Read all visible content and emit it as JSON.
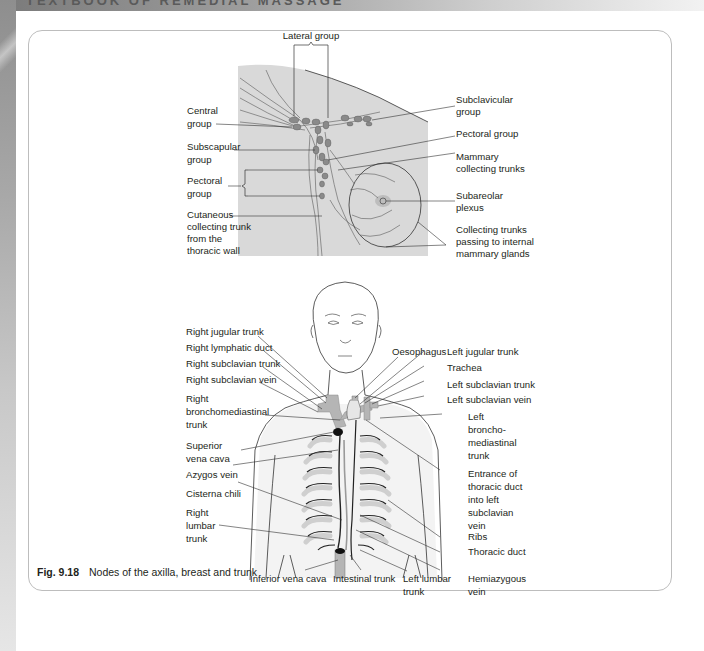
{
  "header": {
    "running_title": "TEXTBOOK OF REMEDIAL MASSAGE"
  },
  "colors": {
    "label_text": "#231f20",
    "diagram_fill": "#d9d9d9",
    "node_fill": "#8a8a8a",
    "vessel_fill": "#b5b5b5",
    "card_border": "#bdbdbd"
  },
  "figure": {
    "number": "Fig. 9.18",
    "caption": "Nodes of the axilla, breast and trunk",
    "axilla_diagram": {
      "labels": {
        "lateral_group": "Lateral group",
        "central_group": [
          "Central",
          "group"
        ],
        "subscapular_group": [
          "Subscapular",
          "group"
        ],
        "pectoral_group_left": [
          "Pectoral",
          "group"
        ],
        "cutaneous_trunk": [
          "Cutaneous",
          "collecting trunk",
          "from the",
          "thoracic wall"
        ],
        "subclavicular_group": [
          "Subclavicular",
          "group"
        ],
        "pectoral_group_right": "Pectoral group",
        "mammary_collecting_trunks": [
          "Mammary",
          "collecting trunks"
        ],
        "subareolar_plexus": [
          "Subareolar",
          "plexus"
        ],
        "collecting_trunks_internal": [
          "Collecting trunks",
          "passing to internal",
          "mammary glands"
        ]
      }
    },
    "trunk_diagram": {
      "labels": {
        "right_jugular_trunk": "Right jugular trunk",
        "right_lymphatic_duct": "Right lymphatic duct",
        "right_subclavian_trunk": "Right subclavian trunk",
        "right_subclavian_vein": "Right subclavian vein",
        "right_bronchomediastinal_trunk": [
          "Right",
          "bronchomediastinal",
          "trunk"
        ],
        "superior_vena_cava": [
          "Superior",
          "vena cava"
        ],
        "azygos_vein": "Azygos vein",
        "cisterna_chili": "Cisterna chili",
        "right_lumbar_trunk": [
          "Right",
          "lumbar",
          "trunk"
        ],
        "oesophagus": "Oesophagus",
        "left_jugular_trunk": "Left jugular trunk",
        "trachea": "Trachea",
        "left_subclavian_trunk": "Left subclavian trunk",
        "left_subclavian_vein": "Left subclavian vein",
        "left_bronchomediastinal_trunk": [
          "Left",
          "broncho-",
          "mediastinal",
          "trunk"
        ],
        "entrance_thoracic_duct": [
          "Entrance of",
          "thoracic duct",
          "into left",
          "subclavian",
          "vein"
        ],
        "ribs": "Ribs",
        "thoracic_duct": "Thoracic duct",
        "hemiazygous_vein": [
          "Hemiazygous",
          "vein"
        ],
        "inferior_vena_cava": "Inferior vena cava",
        "intestinal_trunk": "Intestinal trunk",
        "left_lumbar_trunk": [
          "Left lumbar",
          "trunk"
        ]
      }
    }
  }
}
